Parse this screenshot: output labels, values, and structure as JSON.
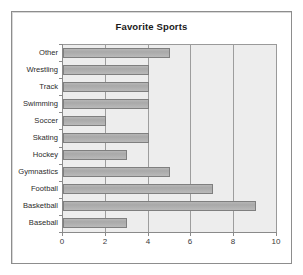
{
  "chart_data": {
    "type": "bar",
    "orientation": "horizontal",
    "title": "Favorite Sports",
    "xlabel": "",
    "ylabel": "",
    "categories": [
      "Baseball",
      "Basketball",
      "Football",
      "Gymnastics",
      "Hockey",
      "Skating",
      "Soccer",
      "Swimming",
      "Track",
      "Wrestling",
      "Other"
    ],
    "values": [
      3,
      9,
      7,
      5,
      3,
      4,
      2,
      4,
      4,
      4,
      5
    ],
    "xlim": [
      0,
      10
    ],
    "xticks": [
      0,
      2,
      4,
      6,
      8,
      10
    ],
    "xtick_labels": [
      "0",
      "2",
      "4",
      "6",
      "8",
      "10"
    ],
    "grid": true,
    "grid_axis": "x",
    "legend": false,
    "bar_color": "#b0b0b0",
    "bar_edge_color": "#7f7f7f",
    "plot_background": "#ededed",
    "figure_background": "#ffffff",
    "frame_color": "#8d8d8d"
  },
  "axis": {
    "x_tick_labels": [
      "0",
      "2",
      "4",
      "6",
      "8",
      "10"
    ],
    "y_tick_labels": [
      "Other",
      "Wrestling",
      "Track",
      "Swimming",
      "Soccer",
      "Skating",
      "Hockey",
      "Gymnastics",
      "Football",
      "Basketball",
      "Baseball"
    ]
  }
}
